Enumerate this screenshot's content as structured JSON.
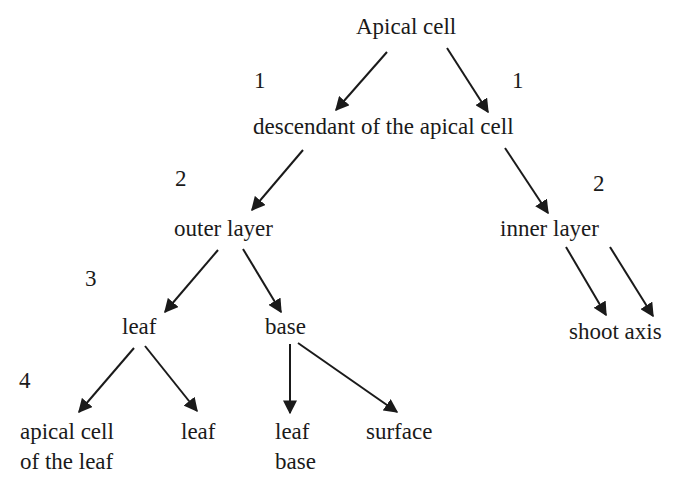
{
  "diagram": {
    "type": "tree",
    "nodes": {
      "apical_cell": "Apical cell",
      "descendant": "descendant of the apical cell",
      "outer_layer": "outer layer",
      "inner_layer": "inner layer",
      "leaf": "leaf",
      "base": "base",
      "shoot_axis": "shoot axis",
      "apical_cell_of_leaf_line1": "apical cell",
      "apical_cell_of_leaf_line2": "of the leaf",
      "leaf_child": "leaf",
      "leaf_base_line1": "leaf",
      "leaf_base_line2": "base",
      "surface": "surface"
    },
    "levels": {
      "level1_left": "1",
      "level1_right": "1",
      "level2_left": "2",
      "level2_right": "2",
      "level3": "3",
      "level4": "4"
    },
    "edges": [
      {
        "from": "Apical cell",
        "to": "descendant of the apical cell",
        "label": "1"
      },
      {
        "from": "Apical cell",
        "to": "descendant of the apical cell",
        "label": "1"
      },
      {
        "from": "descendant of the apical cell",
        "to": "outer layer",
        "label": "2"
      },
      {
        "from": "descendant of the apical cell",
        "to": "inner layer",
        "label": "2"
      },
      {
        "from": "outer layer",
        "to": "leaf",
        "label": "3"
      },
      {
        "from": "outer layer",
        "to": "base",
        "label": "3"
      },
      {
        "from": "inner layer",
        "to": "shoot axis"
      },
      {
        "from": "inner layer",
        "to": "shoot axis"
      },
      {
        "from": "leaf",
        "to": "apical cell of the leaf",
        "label": "4"
      },
      {
        "from": "leaf",
        "to": "leaf",
        "label": "4"
      },
      {
        "from": "base",
        "to": "leaf base",
        "label": "4"
      },
      {
        "from": "base",
        "to": "surface",
        "label": "4"
      }
    ],
    "line_color": "#1a1a1a",
    "text_color": "#1a1a1a",
    "background": "#ffffff"
  }
}
